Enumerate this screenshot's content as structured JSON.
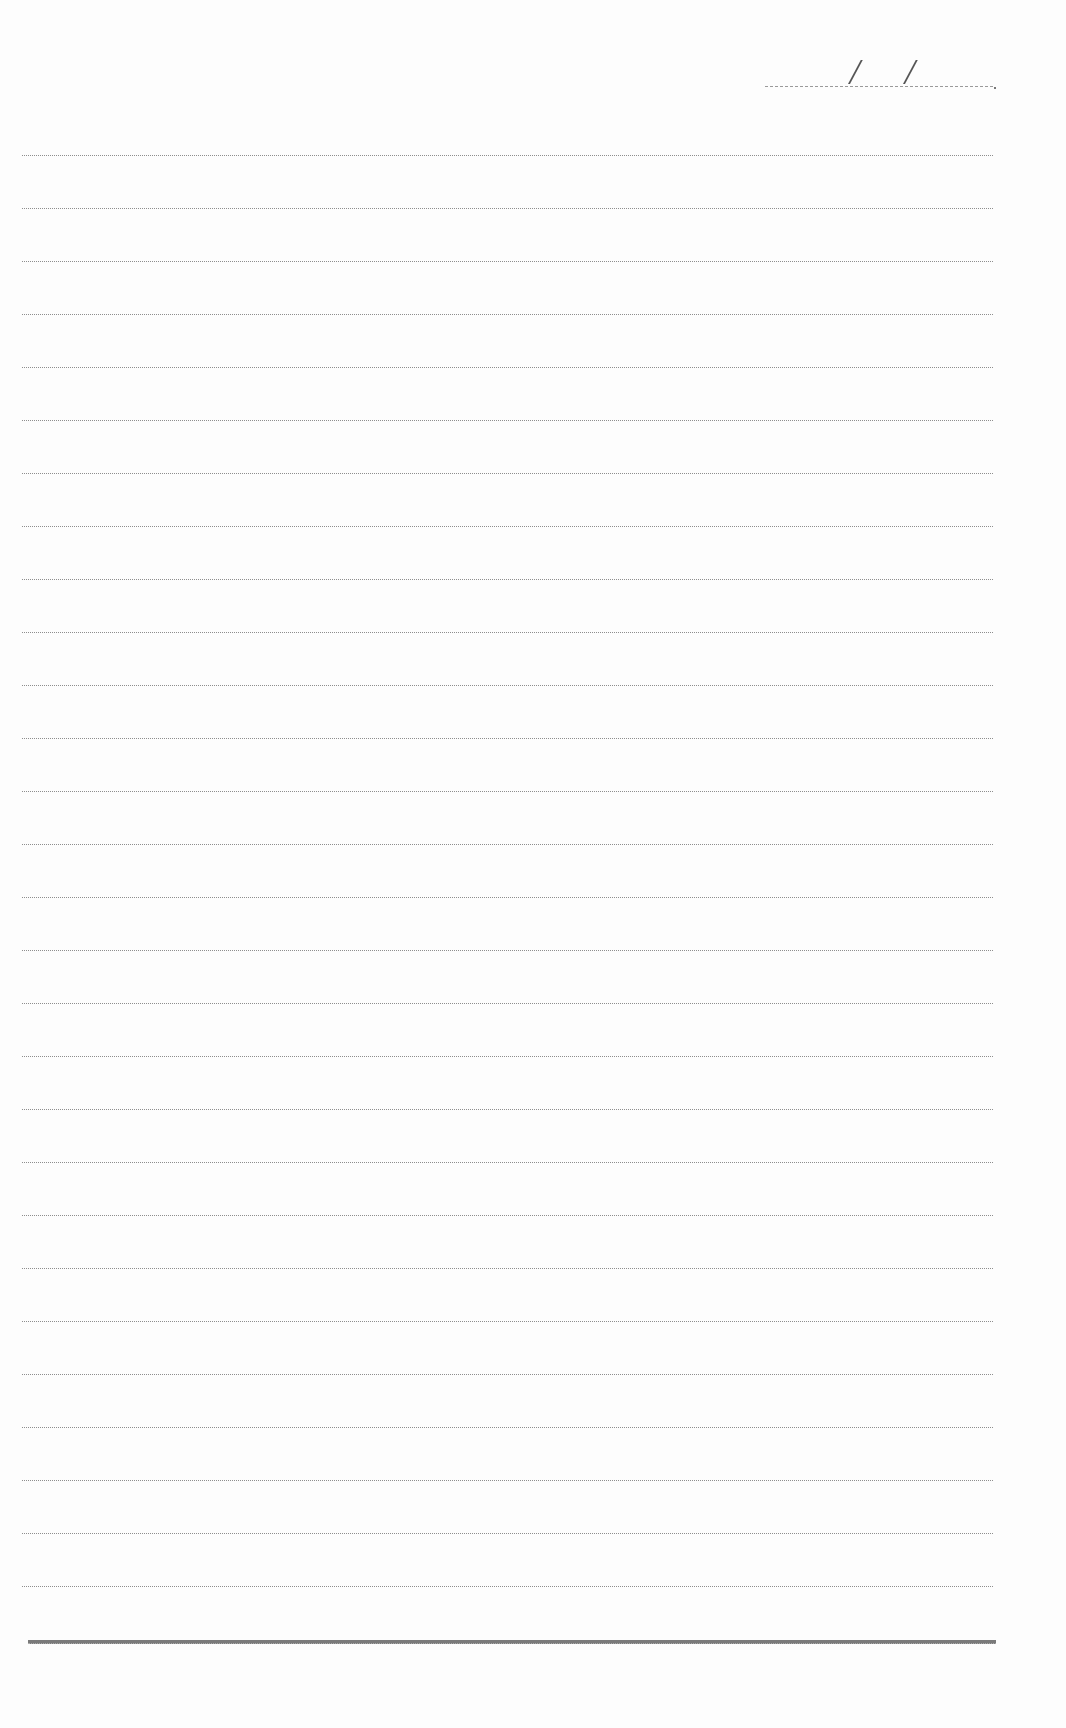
{
  "document": {
    "type": "ruled-notebook-page",
    "date_field": {
      "label": "",
      "separator": "/",
      "value": ""
    },
    "ruled_lines": {
      "count": 28,
      "first_y": 155,
      "spacing": 53,
      "color": "#8e8e8e"
    },
    "bottom_rule": {
      "y": 1640,
      "color": "#7a7a7a"
    },
    "body_text": ""
  }
}
